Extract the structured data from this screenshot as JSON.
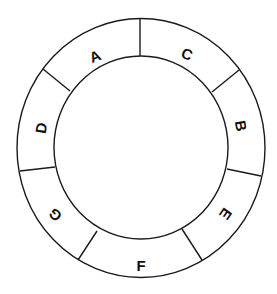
{
  "diagram": {
    "type": "segmented-ring",
    "center": [
      141,
      148
    ],
    "outer_radius": [
      124,
      129
    ],
    "inner_radius": [
      87,
      91
    ],
    "segments": [
      {
        "label": "A",
        "x": 95,
        "y": 56,
        "rotate": -22
      },
      {
        "label": "C",
        "x": 187,
        "y": 54,
        "rotate": 22
      },
      {
        "label": "B",
        "x": 241,
        "y": 126,
        "rotate": 80
      },
      {
        "label": "E",
        "x": 226,
        "y": 214,
        "rotate": 125
      },
      {
        "label": "F",
        "x": 141,
        "y": 265,
        "rotate": 0
      },
      {
        "label": "G",
        "x": 55,
        "y": 215,
        "rotate": -135
      },
      {
        "label": "D",
        "x": 41,
        "y": 128,
        "rotate": -80
      }
    ],
    "dividers": [
      [
        140,
        19,
        140,
        56
      ],
      [
        43,
        69,
        70,
        91
      ],
      [
        239,
        70,
        212,
        92
      ],
      [
        20,
        171,
        55,
        167
      ],
      [
        227,
        169,
        261,
        176
      ],
      [
        78,
        260,
        97,
        231
      ],
      [
        182,
        229,
        202,
        260
      ]
    ]
  }
}
